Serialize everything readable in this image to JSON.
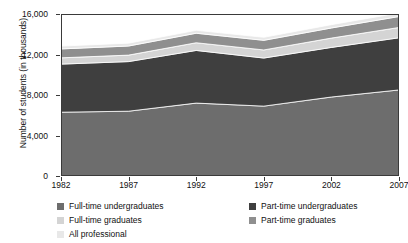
{
  "chart_data": {
    "type": "area",
    "stacked": true,
    "title": "",
    "xlabel": "",
    "ylabel": "Number of students (in thousands)",
    "x": [
      1982,
      1987,
      1992,
      1997,
      2002,
      2007
    ],
    "xtick_labels": [
      "1982",
      "1987",
      "1992",
      "1997",
      "2002",
      "2007"
    ],
    "ytick_labels": [
      "0",
      "4,000",
      "8,000",
      "12,000",
      "16,000"
    ],
    "ytick_values": [
      0,
      4000,
      8000,
      12000,
      16000
    ],
    "ylim": [
      0,
      16000
    ],
    "xlim": [
      1982,
      2007
    ],
    "grid": false,
    "legend_position": "bottom",
    "series": [
      {
        "name": "Full-time undergraduates",
        "color": "#6d6d6d",
        "values": [
          6300,
          6400,
          7200,
          6900,
          7800,
          8500
        ]
      },
      {
        "name": "Part-time undergraduates",
        "color": "#3f3f3f",
        "values": [
          4750,
          4900,
          5200,
          4750,
          4900,
          5150
        ]
      },
      {
        "name": "Full-time graduates",
        "color": "#d4d4d4",
        "values": [
          620,
          640,
          760,
          800,
          920,
          1020
        ]
      },
      {
        "name": "Part-time graduates",
        "color": "#8f8f8f",
        "values": [
          880,
          900,
          940,
          950,
          1000,
          1080
        ]
      },
      {
        "name": "All professional",
        "color": "#e8e8e8",
        "values": [
          280,
          280,
          290,
          300,
          330,
          350
        ]
      }
    ],
    "stack_totals": [
      12830,
      13120,
      14390,
      13700,
      14950,
      16100
    ]
  },
  "legend": {
    "left_items": [
      {
        "label": "Full-time undergraduates",
        "color": "#6d6d6d"
      },
      {
        "label": "Full-time graduates",
        "color": "#d4d4d4"
      },
      {
        "label": "All professional",
        "color": "#e8e8e8"
      }
    ],
    "right_items": [
      {
        "label": "Part-time undergraduates",
        "color": "#3f3f3f"
      },
      {
        "label": "Part-time graduates",
        "color": "#8f8f8f"
      }
    ]
  },
  "axis": {
    "y_title": "Number of students (in thousands)"
  }
}
